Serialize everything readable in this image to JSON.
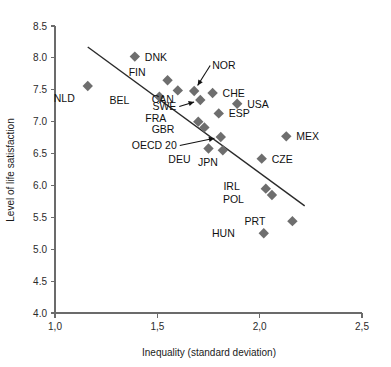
{
  "chart_data": {
    "type": "scatter",
    "title": "",
    "xlabel": "Inequality (standard deviation)",
    "ylabel": "Level of life satisfaction",
    "xlim": [
      1.0,
      2.5
    ],
    "ylim": [
      4.0,
      8.5
    ],
    "xticks": [
      "1,0",
      "1,5",
      "2,0",
      "2,5"
    ],
    "xtick_values": [
      1.0,
      1.5,
      2.0,
      2.5
    ],
    "yticks": [
      "4.0",
      "4.5",
      "5.0",
      "5.5",
      "6.0",
      "6.5",
      "7.0",
      "7.5",
      "8.0",
      "8.5"
    ],
    "ytick_values": [
      4.0,
      4.5,
      5.0,
      5.5,
      6.0,
      6.5,
      7.0,
      7.5,
      8.0,
      8.5
    ],
    "grid": false,
    "legend": "none",
    "marker_shape": "diamond",
    "marker_color": "#6e6e6e",
    "trendline": {
      "label": "linear fit",
      "x_start": 1.16,
      "y_start": 8.17,
      "x_end": 2.22,
      "y_end": 5.68
    },
    "points": [
      {
        "code": "DNK",
        "x": 1.39,
        "y": 8.02,
        "label_dx": 10,
        "label_dy": 4,
        "leader": false
      },
      {
        "code": "FIN",
        "x": 1.55,
        "y": 7.65,
        "label_dx": -22,
        "label_dy": -4,
        "leader": false
      },
      {
        "code": "NLD",
        "x": 1.16,
        "y": 7.56,
        "label_dx": -13,
        "label_dy": 16,
        "leader": false
      },
      {
        "code": "CAN",
        "x": 1.6,
        "y": 7.49,
        "label_dx": -4,
        "label_dy": 13,
        "leader": false
      },
      {
        "code": "NOR",
        "x": 1.68,
        "y": 7.48,
        "label_dx": 18,
        "label_dy": -22,
        "leader": true
      },
      {
        "code": "CHE",
        "x": 1.77,
        "y": 7.45,
        "label_dx": 10,
        "label_dy": 4,
        "leader": false
      },
      {
        "code": "BEL",
        "x": 1.51,
        "y": 7.39,
        "label_dx": -30,
        "label_dy": 7,
        "leader": false
      },
      {
        "code": "SWE",
        "x": 1.71,
        "y": 7.34,
        "label_dx": -24,
        "label_dy": 10,
        "leader": true
      },
      {
        "code": "USA",
        "x": 1.89,
        "y": 7.28,
        "label_dx": 10,
        "label_dy": 4,
        "leader": false
      },
      {
        "code": "ESP",
        "x": 1.8,
        "y": 7.13,
        "label_dx": 10,
        "label_dy": 4,
        "leader": false
      },
      {
        "code": "FRA",
        "x": 1.7,
        "y": 7.0,
        "label_dx": -32,
        "label_dy": 0,
        "leader": false
      },
      {
        "code": "GBR",
        "x": 1.73,
        "y": 6.91,
        "label_dx": -30,
        "label_dy": 6,
        "leader": false
      },
      {
        "code": "OECD 20",
        "x": 1.81,
        "y": 6.76,
        "label_dx": -44,
        "label_dy": 12,
        "leader": true
      },
      {
        "code": "MEX",
        "x": 2.13,
        "y": 6.77,
        "label_dx": 10,
        "label_dy": 4,
        "leader": false
      },
      {
        "code": "DEU",
        "x": 1.75,
        "y": 6.58,
        "label_dx": -18,
        "label_dy": 15,
        "leader": false
      },
      {
        "code": "JPN",
        "x": 1.82,
        "y": 6.55,
        "label_dx": -5,
        "label_dy": 16,
        "leader": false
      },
      {
        "code": "CZE",
        "x": 2.01,
        "y": 6.42,
        "label_dx": 10,
        "label_dy": 4,
        "leader": false
      },
      {
        "code": "IRL",
        "x": 2.03,
        "y": 5.95,
        "label_dx": -26,
        "label_dy": 1,
        "leader": false
      },
      {
        "code": "POL",
        "x": 2.06,
        "y": 5.85,
        "label_dx": -28,
        "label_dy": 8,
        "leader": false
      },
      {
        "code": "PRT",
        "x": 2.16,
        "y": 5.44,
        "label_dx": -27,
        "label_dy": 4,
        "leader": false
      },
      {
        "code": "HUN",
        "x": 2.02,
        "y": 5.25,
        "label_dx": -29,
        "label_dy": 4,
        "leader": false
      }
    ]
  }
}
